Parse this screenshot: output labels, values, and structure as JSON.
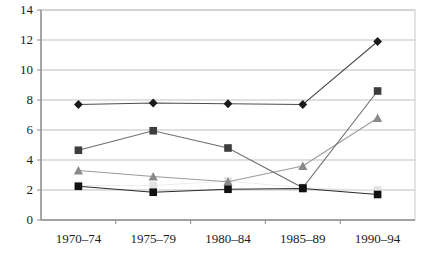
{
  "chart_data": {
    "type": "line",
    "title": "",
    "subtitle": "",
    "xlabel": "",
    "ylabel": "",
    "categories": [
      "1970–74",
      "1975–79",
      "1980–84",
      "1985–89",
      "1990–94"
    ],
    "ylim": [
      0,
      14
    ],
    "ytick_labels": [
      "0",
      "2",
      "4",
      "6",
      "8",
      "10",
      "12",
      "14"
    ],
    "ytick_values": [
      0,
      2,
      4,
      6,
      8,
      10,
      12,
      14
    ],
    "grid": "horizontal",
    "legend_position": "none",
    "series": [
      {
        "name": "series-1-diamond",
        "marker": "diamond",
        "color": "#1a1a1a",
        "line_color": "#4d4d4d",
        "values": [
          7.7,
          7.8,
          7.75,
          7.7,
          11.9
        ]
      },
      {
        "name": "series-2-dark-square",
        "marker": "square",
        "color": "#3d3d3d",
        "line_color": "#6e6e6e",
        "values": [
          4.65,
          5.95,
          4.8,
          2.15,
          8.6
        ]
      },
      {
        "name": "series-3-triangle",
        "marker": "triangle",
        "color": "#8a8a8a",
        "line_color": "#9a9a9a",
        "values": [
          3.3,
          2.9,
          2.55,
          3.6,
          6.8
        ]
      },
      {
        "name": "series-4-black-square",
        "marker": "square",
        "color": "#111111",
        "line_color": "#2b2b2b",
        "values": [
          2.25,
          1.85,
          2.05,
          2.1,
          1.7
        ]
      },
      {
        "name": "series-5-light-square",
        "marker": "square",
        "color": "#e2e2e2",
        "line_color": "#ededed",
        "values": [
          2.3,
          2.3,
          2.6,
          2.15,
          2.0
        ]
      }
    ],
    "colors": {
      "axis": "#8c8c8c",
      "gridline": "#bfbfbf",
      "plot_background": "#ffffff",
      "tick_text": "#1c1c1c"
    }
  }
}
